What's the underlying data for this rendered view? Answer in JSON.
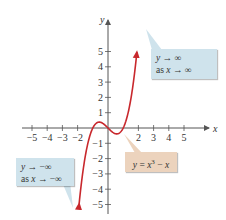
{
  "chart_data": {
    "type": "line",
    "title": "",
    "xlabel": "x",
    "ylabel": "y",
    "xlim": [
      -5.5,
      6
    ],
    "ylim": [
      -5.5,
      6
    ],
    "grid": false,
    "x_ticks": [
      -5,
      -4,
      -3,
      -2,
      2,
      3,
      4,
      5
    ],
    "x_tick_labels": [
      "−5",
      "−4",
      "−3",
      "−2",
      "2",
      "3",
      "4",
      "5"
    ],
    "y_ticks": [
      5,
      4,
      3,
      2,
      1,
      -1,
      -2,
      -3,
      -4,
      -5
    ],
    "y_tick_labels": [
      "5",
      "4",
      "3",
      "2",
      "1",
      "−1",
      "−2",
      "−3",
      "−4",
      "−5"
    ],
    "series": [
      {
        "name": "y = x^3 − x",
        "function": "x^3 - x",
        "x_range": [
          -1.9,
          1.9
        ],
        "color": "#c8282d",
        "arrows": "both",
        "points": [
          {
            "x": -1.9,
            "y": -4.96
          },
          {
            "x": -1.5,
            "y": -1.875
          },
          {
            "x": -1.0,
            "y": 0
          },
          {
            "x": -0.577,
            "y": 0.385
          },
          {
            "x": 0,
            "y": 0
          },
          {
            "x": 0.577,
            "y": -0.385
          },
          {
            "x": 1.0,
            "y": 0
          },
          {
            "x": 1.5,
            "y": 1.875
          },
          {
            "x": 1.9,
            "y": 4.96
          }
        ]
      }
    ],
    "annotations": [
      {
        "text_line1": "y → ∞",
        "text_line2": "as x → ∞",
        "points_to": "upper arrow end",
        "color": "#cfe3ec"
      },
      {
        "text_line1": "y → −∞",
        "text_line2": "as x → −∞",
        "points_to": "lower arrow end",
        "color": "#cfe3ec"
      },
      {
        "text": "y = x³ − x",
        "points_to": "curve near local minimum",
        "color": "#ecd3bd"
      }
    ]
  },
  "axes": {
    "x_label": "x",
    "y_label": "y",
    "x_ticks": [
      {
        "label": "−5",
        "value": -5
      },
      {
        "label": "−4",
        "value": -4
      },
      {
        "label": "−3",
        "value": -3
      },
      {
        "label": "−2",
        "value": -2
      },
      {
        "label": "2",
        "value": 2
      },
      {
        "label": "3",
        "value": 3
      },
      {
        "label": "4",
        "value": 4
      },
      {
        "label": "5",
        "value": 5
      }
    ],
    "y_ticks": [
      {
        "label": "5",
        "value": 5
      },
      {
        "label": "4",
        "value": 4
      },
      {
        "label": "3",
        "value": 3
      },
      {
        "label": "2",
        "value": 2
      },
      {
        "label": "1",
        "value": 1
      },
      {
        "label": "−1",
        "value": -1
      },
      {
        "label": "−2",
        "value": -2
      },
      {
        "label": "−3",
        "value": -3
      },
      {
        "label": "−4",
        "value": -4
      },
      {
        "label": "−5",
        "value": -5
      }
    ]
  },
  "callouts": {
    "upper": {
      "line1_a": "y",
      "line1_b": " → ∞",
      "line2_a": "as ",
      "line2_b": "x",
      "line2_c": " → ∞"
    },
    "lower": {
      "line1_a": "y",
      "line1_b": " → −∞",
      "line2_a": "as ",
      "line2_b": "x",
      "line2_c": " → −∞"
    },
    "equation": {
      "a": "y",
      "b": " = ",
      "c": "x",
      "sup": "3",
      "d": " − ",
      "e": "x"
    }
  },
  "colors": {
    "curve": "#c8282d",
    "axis": "#555555",
    "callout_blue": "#cfe3ec",
    "callout_tan": "#ecd3bd"
  }
}
